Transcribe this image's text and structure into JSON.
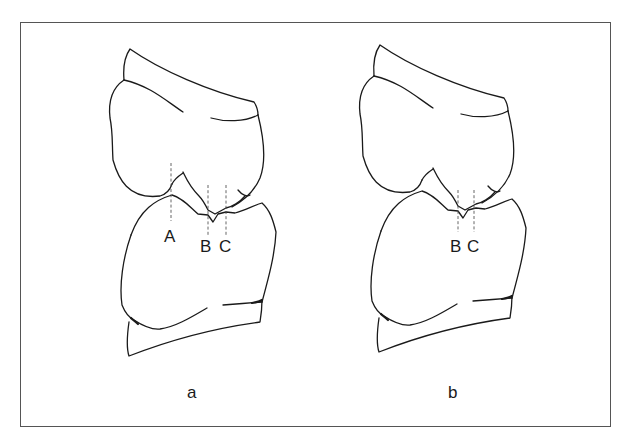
{
  "figure": {
    "panels": [
      {
        "id": "a",
        "caption": "a",
        "reference_lines": [
          {
            "label": "A",
            "x": 171
          },
          {
            "label": "B",
            "x": 208
          },
          {
            "label": "C",
            "x": 226
          }
        ]
      },
      {
        "id": "b",
        "caption": "b",
        "reference_lines": [
          {
            "label": "B",
            "x": 458
          },
          {
            "label": "C",
            "x": 474
          }
        ]
      }
    ],
    "colors": {
      "line": "#1a1a1a",
      "dashed": "#555555",
      "frame": "#555555",
      "background": "#ffffff"
    }
  }
}
